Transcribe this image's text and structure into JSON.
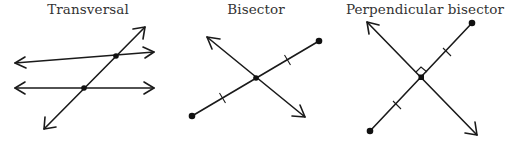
{
  "figures": [
    {
      "id": "transversal",
      "title": "Transversal",
      "title_x": 88
    },
    {
      "id": "bisector",
      "title": "Bisector",
      "title_x": 256
    },
    {
      "id": "perpendicular-bisector",
      "title": "Perpendicular bisector",
      "title_x": 425
    }
  ],
  "colors": {
    "stroke": "#1a1a1a",
    "text": "#333333",
    "background": "#ffffff"
  }
}
